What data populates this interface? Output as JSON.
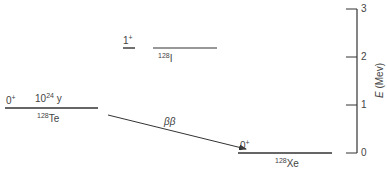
{
  "diagram": {
    "type": "nuclear-energy-level-diagram",
    "levels": [
      {
        "nucleus": "Te",
        "mass_number": "128",
        "spin_parity": "0",
        "parity_sign": "+",
        "half_life_base": "10",
        "half_life_exp": "24",
        "half_life_unit": "y",
        "energy_mev": 0.9
      },
      {
        "nucleus": "I",
        "mass_number": "128",
        "spin_parity": "1",
        "parity_sign": "+",
        "energy_mev": 2.1
      },
      {
        "nucleus": "Xe",
        "mass_number": "128",
        "spin_parity": "0",
        "parity_sign": "+",
        "energy_mev": 0
      }
    ],
    "transition": {
      "label": "ββ",
      "from": "Te",
      "to": "Xe"
    },
    "axis": {
      "title_symbol": "E",
      "title_unit": "(Mev)",
      "ticks": [
        "3",
        "2",
        "1",
        "0"
      ]
    }
  },
  "colors": {
    "line": "#333333",
    "text": "#444444",
    "background": "#ffffff"
  }
}
